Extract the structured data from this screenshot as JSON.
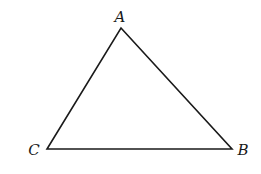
{
  "figure": {
    "type": "triangle",
    "stroke_color": "#1a1a1a",
    "background": "#ffffff",
    "vertices": [
      {
        "name": "A",
        "label": "A",
        "x": 121,
        "y": 28,
        "label_x": 120,
        "label_y": 22
      },
      {
        "name": "B",
        "label": "B",
        "x": 232,
        "y": 149,
        "label_x": 243,
        "label_y": 155
      },
      {
        "name": "C",
        "label": "C",
        "x": 47,
        "y": 149,
        "label_x": 34,
        "label_y": 155
      }
    ],
    "sides": [
      "AB",
      "BC",
      "CA"
    ]
  }
}
